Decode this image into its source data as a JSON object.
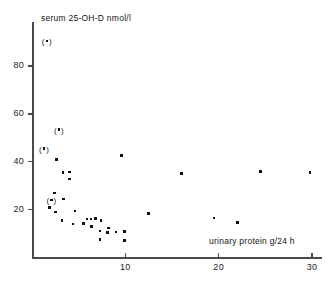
{
  "chart_data": {
    "type": "scatter",
    "title": "",
    "ylabel": "serum  25-OH-D nmol/l",
    "xlabel": "urinary protein  g/24 h",
    "xlim": [
      0,
      30.5
    ],
    "ylim": [
      0,
      92
    ],
    "grid": false,
    "legend": null,
    "xticks": [
      10,
      20,
      30
    ],
    "xtick_labels": [
      "10",
      "20",
      "30"
    ],
    "yticks": [
      20,
      40,
      60,
      80
    ],
    "ytick_labels": [
      "20",
      "40",
      "60",
      "80"
    ],
    "series": [
      {
        "name": "patients",
        "marker": "square-dot",
        "points": [
          {
            "x": 2.6,
            "y": 41.0
          },
          {
            "x": 3.3,
            "y": 35.5
          },
          {
            "x": 4.0,
            "y": 35.8
          },
          {
            "x": 4.0,
            "y": 32.8
          },
          {
            "x": 2.4,
            "y": 27.0
          },
          {
            "x": 3.4,
            "y": 24.5
          },
          {
            "x": 1.9,
            "y": 21.0
          },
          {
            "x": 2.5,
            "y": 19.0
          },
          {
            "x": 3.2,
            "y": 15.5
          },
          {
            "x": 4.6,
            "y": 19.5
          },
          {
            "x": 4.4,
            "y": 14.0
          },
          {
            "x": 5.5,
            "y": 14.2
          },
          {
            "x": 5.9,
            "y": 16.0
          },
          {
            "x": 6.3,
            "y": 16.0
          },
          {
            "x": 6.4,
            "y": 13.0
          },
          {
            "x": 6.8,
            "y": 16.2
          },
          {
            "x": 7.4,
            "y": 15.4
          },
          {
            "x": 7.3,
            "y": 11.0
          },
          {
            "x": 7.3,
            "y": 7.4
          },
          {
            "x": 8.2,
            "y": 12.4
          },
          {
            "x": 8.1,
            "y": 10.5
          },
          {
            "x": 9.0,
            "y": 10.6
          },
          {
            "x": 9.6,
            "y": 42.5
          },
          {
            "x": 9.9,
            "y": 10.8
          },
          {
            "x": 9.9,
            "y": 7.2
          },
          {
            "x": 12.5,
            "y": 18.5
          },
          {
            "x": 16.0,
            "y": 35.0
          },
          {
            "x": 19.5,
            "y": 16.5
          },
          {
            "x": 24.5,
            "y": 36.0
          },
          {
            "x": 29.8,
            "y": 35.5
          },
          {
            "x": 22.0,
            "y": 14.5
          }
        ]
      },
      {
        "name": "bracketed-values",
        "marker": "parenthesised-dot",
        "points": [
          {
            "x": 1.7,
            "y": 90.0
          },
          {
            "x": 3.0,
            "y": 53.0
          },
          {
            "x": 1.4,
            "y": 45.0
          },
          {
            "x": 2.2,
            "y": 23.5
          }
        ]
      }
    ]
  }
}
